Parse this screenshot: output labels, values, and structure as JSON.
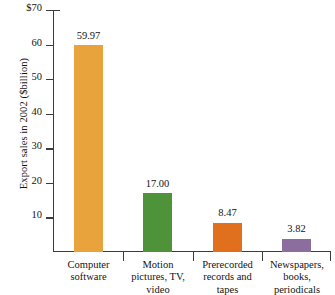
{
  "chart_data": {
    "type": "bar",
    "title": "",
    "xlabel": "",
    "ylabel": "Export sales in 2002 ($billion)",
    "ylim": [
      0,
      70
    ],
    "ytick_labels": [
      "$70",
      "60",
      "50",
      "40",
      "30",
      "20",
      "10"
    ],
    "ytick_values": [
      70,
      60,
      50,
      40,
      30,
      20,
      10
    ],
    "grid": false,
    "legend": "none",
    "categories": [
      "Computer software",
      "Motion pictures, TV, video",
      "Prerecorded records and tapes",
      "Newspapers, books, periodicals"
    ],
    "values": [
      59.97,
      17.0,
      8.47,
      3.82
    ],
    "value_labels": [
      "59.97",
      "17.00",
      "8.47",
      "3.82"
    ],
    "colors": [
      "#E8A33D",
      "#4E9239",
      "#E0701E",
      "#8C6E9E"
    ],
    "bars": [
      {
        "label": "Computer software",
        "label_line1": "Computer",
        "label_line2": "software",
        "label_line3": "",
        "value": 59.97,
        "value_label": "59.97",
        "color": "#E8A33D"
      },
      {
        "label": "Motion pictures, TV, video",
        "label_line1": "Motion",
        "label_line2": "pictures, TV,",
        "label_line3": "video",
        "value": 17.0,
        "value_label": "17.00",
        "color": "#4E9239"
      },
      {
        "label": "Prerecorded records and tapes",
        "label_line1": "Prerecorded",
        "label_line2": "records and",
        "label_line3": "tapes",
        "value": 8.47,
        "value_label": "8.47",
        "color": "#E0701E"
      },
      {
        "label": "Newspapers, books, periodicals",
        "label_line1": "Newspapers,",
        "label_line2": "books,",
        "label_line3": "periodicals",
        "value": 3.82,
        "value_label": "3.82",
        "color": "#8C6E9E"
      }
    ]
  },
  "axis": {
    "line_color": "#3b3b41"
  }
}
